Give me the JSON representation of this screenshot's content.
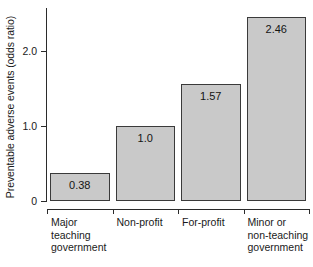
{
  "chart_data": {
    "type": "bar",
    "title": "",
    "xlabel": "",
    "ylabel": "Preventable adverse events (odds ratio)",
    "categories": [
      "Major\nteaching\ngovernment",
      "Non-profit",
      "For-profit",
      "Minor or\nnon-teaching\ngovernment"
    ],
    "values": [
      0.38,
      1.0,
      1.57,
      2.46
    ],
    "value_labels": [
      "0.38",
      "1.0",
      "1.57",
      "2.46"
    ],
    "ylim": [
      0,
      2.6
    ],
    "yticks": [
      0,
      1.0,
      2.0
    ],
    "ytick_labels": [
      "0",
      "1.0",
      "2.0"
    ],
    "grid": false,
    "legend": null,
    "bar_color": "#c9c9c9",
    "bar_edge_color": "#3a3a3a",
    "axis_color": "#2b2b2b"
  }
}
